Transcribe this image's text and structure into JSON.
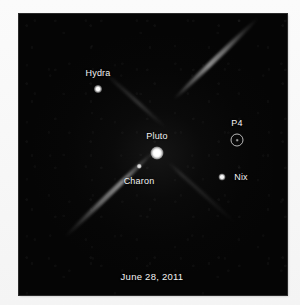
{
  "image": {
    "kind": "astronomical-photo",
    "background_color": "#050505",
    "page_background_color": "#f7f7f7",
    "label_color": "#f3f3f3",
    "caption": "June 28, 2011"
  },
  "objects": [
    {
      "id": "hydra",
      "label": "Hydra",
      "marker": "point-source",
      "x": 98,
      "y": 89,
      "label_x": 98,
      "label_y": 73
    },
    {
      "id": "pluto",
      "label": "Pluto",
      "marker": "point-source",
      "x": 157,
      "y": 153,
      "label_x": 157,
      "label_y": 136
    },
    {
      "id": "charon",
      "label": "Charon",
      "marker": "point-source",
      "x": 139,
      "y": 166,
      "label_x": 139,
      "label_y": 181
    },
    {
      "id": "nix",
      "label": "Nix",
      "marker": "point-source",
      "x": 222,
      "y": 177,
      "label_x": 241,
      "label_y": 177
    },
    {
      "id": "p4",
      "label": "P4",
      "marker": "circled-point-source",
      "x": 237,
      "y": 140,
      "label_x": 237,
      "label_y": 123
    }
  ],
  "features": {
    "diffraction_spikes": [
      {
        "id": "spike-main-northeast",
        "name": "diffraction-spike-northeast"
      },
      {
        "id": "spike-main-southwest",
        "name": "diffraction-spike-southwest"
      },
      {
        "id": "spike-northwest",
        "name": "diffraction-spike-northwest"
      },
      {
        "id": "spike-southeast",
        "name": "diffraction-spike-southeast"
      }
    ]
  }
}
